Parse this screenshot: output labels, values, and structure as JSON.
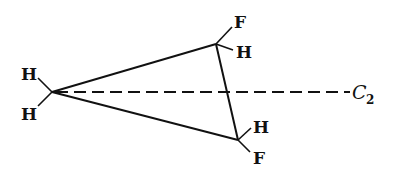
{
  "diagram": {
    "left_center": {
      "substituents": [
        "H",
        "H"
      ]
    },
    "top_center": {
      "substituents": [
        "F",
        "H"
      ]
    },
    "bottom_center": {
      "substituents": [
        "H",
        "F"
      ]
    },
    "axis": {
      "label": "C",
      "subscript": "2",
      "style": "dashed"
    }
  }
}
